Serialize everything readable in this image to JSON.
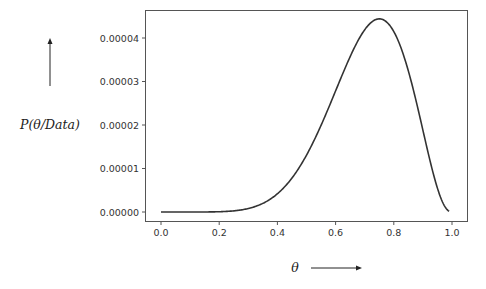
{
  "chart_data": {
    "type": "line",
    "title": "",
    "xlabel": "θ",
    "ylabel": "P(θ/Data)",
    "xlim": [
      -0.05,
      1.05
    ],
    "ylim": [
      -2.1e-06,
      4.56e-05
    ],
    "grid": false,
    "legend": null,
    "x_ticks": [
      0.0,
      0.2,
      0.4,
      0.6,
      0.8,
      1.0
    ],
    "x_tick_labels": [
      "0.0",
      "0.2",
      "0.4",
      "0.6",
      "0.8",
      "1.0"
    ],
    "y_ticks": [
      0.0,
      1e-05,
      2e-05,
      3e-05,
      4e-05
    ],
    "y_tick_labels": [
      "0.00000",
      "0.00001",
      "0.00002",
      "0.00003",
      "0.00004"
    ],
    "series": [
      {
        "name": "posterior",
        "color": "#333333",
        "x": [
          0.0,
          0.05,
          0.1,
          0.15,
          0.2,
          0.25,
          0.3,
          0.35,
          0.4,
          0.45,
          0.5,
          0.55,
          0.6,
          0.65,
          0.7,
          0.75,
          0.8,
          0.85,
          0.9,
          0.95,
          0.99
        ],
        "y": [
          0.0,
          0.0,
          7e-10,
          1.2e-08,
          6.4e-08,
          2.6e-07,
          8e-07,
          2e-06,
          4.3e-06,
          8e-06,
          1.31e-05,
          1.99e-05,
          2.8e-05,
          3.62e-05,
          4.19e-05,
          4.44e-05,
          4.14e-05,
          3.28e-05,
          1.89e-05,
          5.5e-06,
          3e-07
        ]
      }
    ]
  },
  "labels": {
    "ylabel": "P(θ/Data)",
    "xlabel": "θ"
  }
}
